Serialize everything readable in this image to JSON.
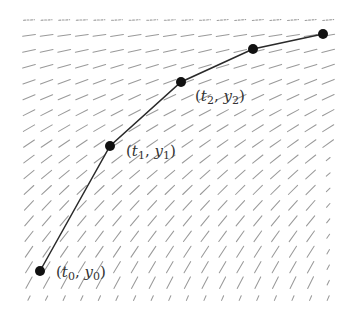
{
  "diagram": {
    "type": "slope field with Euler method approximation",
    "colors": {
      "background": "#ffffff",
      "field": "#9a9a9a",
      "solution": "#2a2a2a",
      "dots": "#111111",
      "labels": "#333333"
    },
    "field": {
      "x_start": 29,
      "x_step": 17.6,
      "cols": 18,
      "y_start": 20,
      "y_step": 15.45,
      "rows": 19,
      "seg_half_len": 6.5
    },
    "points": [
      {
        "id": "p0",
        "x": 40,
        "y": 271,
        "label_t": "t",
        "label_t_sub": "0",
        "label_y": "y",
        "label_y_sub": "0",
        "label_x": 56,
        "label_y_pos": 277
      },
      {
        "id": "p1",
        "x": 110,
        "y": 146,
        "label_t": "t",
        "label_t_sub": "1",
        "label_y": "y",
        "label_y_sub": "1",
        "label_x": 126,
        "label_y_pos": 156
      },
      {
        "id": "p2",
        "x": 181,
        "y": 82,
        "label_t": "t",
        "label_t_sub": "2",
        "label_y": "y",
        "label_y_sub": "2",
        "label_x": 195,
        "label_y_pos": 101
      },
      {
        "id": "p3",
        "x": 253,
        "y": 49
      },
      {
        "id": "p4",
        "x": 323,
        "y": 34
      }
    ],
    "labels": {
      "p0": {
        "open": "(",
        "t": "t",
        "t_sub": "0",
        "comma": ", ",
        "y": "y",
        "y_sub": "0",
        "close": ")"
      },
      "p1": {
        "open": "(",
        "t": "t",
        "t_sub": "1",
        "comma": ", ",
        "y": "y",
        "y_sub": "1",
        "close": ")"
      },
      "p2": {
        "open": "(",
        "t": "t",
        "t_sub": "2",
        "comma": ", ",
        "y": "y",
        "y_sub": "2",
        "close": ")"
      }
    }
  }
}
